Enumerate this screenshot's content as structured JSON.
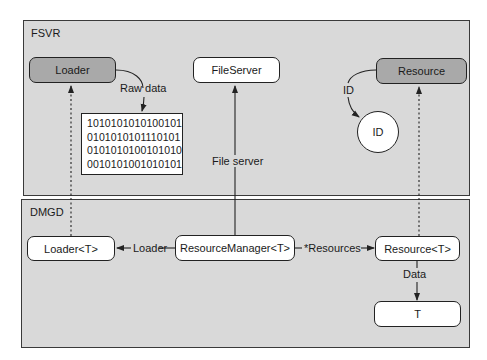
{
  "regions": {
    "fsvr": {
      "label": "FSVR"
    },
    "dmgd": {
      "label": "DMGD"
    }
  },
  "fsvr_nodes": {
    "loader": "Loader",
    "fileserver": "FileServer",
    "resource": "Resource",
    "id_circle": "ID",
    "raw_data_lines": [
      "1010101010100101",
      "0101010101110101",
      "0101010100101010",
      "0010101001010101"
    ]
  },
  "dmgd_nodes": {
    "loader_t": "Loader<T>",
    "resource_manager": "ResourceManager<T>",
    "resource_t": "Resource<T>",
    "t": "T"
  },
  "edge_labels": {
    "raw_data": "Raw data",
    "id": "ID",
    "file_server": "File server",
    "loader": "Loader",
    "resources": "*Resources",
    "data": "Data"
  },
  "colors": {
    "region_bg": "#d9d9d9",
    "dark_node": "#a9a9a9",
    "light_node": "#ffffff",
    "stroke": "#222222"
  }
}
